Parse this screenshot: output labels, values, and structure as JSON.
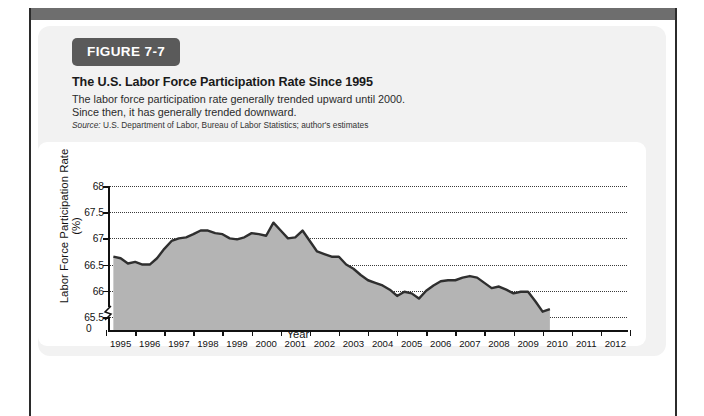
{
  "figure": {
    "badge": "FIGURE 7-7",
    "title": "The U.S. Labor Force Participation Rate Since 1995",
    "subtitle_line1": "The labor force participation rate generally trended upward until 2000.",
    "subtitle_line2": "Since then, it has generally trended downward.",
    "source_prefix": "Source:",
    "source_text": "U.S. Department of Labor, Bureau of Labor Statistics; author's estimates"
  },
  "colors": {
    "badge_bg": "#5a5a5a",
    "area_fill": "#b4b4b4",
    "line": "#2f2f2f",
    "card_bg": "#f2f2f2",
    "panel_bg": "#ffffff",
    "grid": "#3a3a3a",
    "axis": "#111111",
    "page_bar": "#6e6e6e"
  },
  "chart_data": {
    "type": "area",
    "title": "The U.S. Labor Force Participation Rate Since 1995",
    "xlabel": "Year",
    "ylabel": "Labor Force Participation Rate (%)",
    "ylim": [
      65.25,
      68.0
    ],
    "yticks": [
      65.5,
      66,
      66.5,
      67,
      67.5,
      68
    ],
    "ytick_labels": [
      "65.5",
      "66",
      "66.5",
      "67",
      "67.5",
      "68"
    ],
    "zero_tick_label": "0",
    "axis_break": true,
    "grid": "horizontal-dotted",
    "legend": "none",
    "xlim": [
      1994.6,
      2012.4
    ],
    "xticks": [
      1995,
      1996,
      1997,
      1998,
      1999,
      2000,
      2001,
      2002,
      2003,
      2004,
      2005,
      2006,
      2007,
      2008,
      2009,
      2010,
      2011,
      2012
    ],
    "xtick_labels": [
      "1995",
      "1996",
      "1997",
      "1998",
      "1999",
      "2000",
      "2001",
      "2002",
      "2003",
      "2004",
      "2005",
      "2006",
      "2007",
      "2008",
      "2009",
      "2010",
      "2011",
      "2012"
    ],
    "data_end_x": 2009.75,
    "series": [
      {
        "name": "Labor Force Participation Rate",
        "x": [
          1994.75,
          1995.0,
          1995.25,
          1995.5,
          1995.75,
          1996.0,
          1996.25,
          1996.5,
          1996.75,
          1997.0,
          1997.25,
          1997.5,
          1997.75,
          1998.0,
          1998.25,
          1998.5,
          1998.75,
          1999.0,
          1999.25,
          1999.5,
          1999.75,
          2000.0,
          2000.25,
          2000.5,
          2000.75,
          2001.0,
          2001.25,
          2001.5,
          2001.75,
          2002.0,
          2002.25,
          2002.5,
          2002.75,
          2003.0,
          2003.25,
          2003.5,
          2003.75,
          2004.0,
          2004.25,
          2004.5,
          2004.75,
          2005.0,
          2005.25,
          2005.5,
          2005.75,
          2006.0,
          2006.25,
          2006.5,
          2006.75,
          2007.0,
          2007.25,
          2007.5,
          2007.75,
          2008.0,
          2008.25,
          2008.5,
          2008.75,
          2009.0,
          2009.25,
          2009.5,
          2009.75
        ],
        "values": [
          66.65,
          66.62,
          66.52,
          66.55,
          66.5,
          66.5,
          66.62,
          66.8,
          66.95,
          67.0,
          67.02,
          67.08,
          67.15,
          67.15,
          67.1,
          67.08,
          67.0,
          66.98,
          67.02,
          67.1,
          67.08,
          67.05,
          67.3,
          67.15,
          67.0,
          67.02,
          67.15,
          66.95,
          66.75,
          66.7,
          66.65,
          66.65,
          66.5,
          66.42,
          66.3,
          66.2,
          66.15,
          66.1,
          66.02,
          65.9,
          65.98,
          65.95,
          65.85,
          66.0,
          66.1,
          66.18,
          66.2,
          66.2,
          66.25,
          66.28,
          66.25,
          66.15,
          66.05,
          66.08,
          66.02,
          65.95,
          65.98,
          65.98,
          65.8,
          65.6,
          65.65
        ]
      }
    ]
  }
}
